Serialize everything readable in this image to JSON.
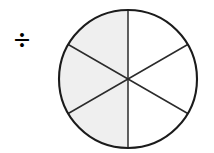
{
  "figure": {
    "name": "fraction-circle-division",
    "background_color": "#ffffff",
    "operator": {
      "glyph": "÷",
      "label": "division-sign",
      "color": "#000000"
    },
    "circle": {
      "center_x": 128,
      "center_y": 79,
      "radius": 69,
      "outline_color": "#1b1b1b",
      "outline_width": 2,
      "divider_color": "#2b2b2b",
      "divider_width": 1.5,
      "total_sectors": 6,
      "shaded_sectors": 3,
      "unshaded_sectors": 3,
      "shaded_fill": "#efefef",
      "unshaded_fill": "#ffffff",
      "fraction_shaded": "3/6",
      "sector_angle_degrees": 60,
      "diameter_angles_degrees": [
        90,
        30,
        150
      ],
      "sectors": [
        {
          "id": "sector-1",
          "start_deg": 90,
          "end_deg": 150,
          "shaded": true
        },
        {
          "id": "sector-2",
          "start_deg": 150,
          "end_deg": 210,
          "shaded": true
        },
        {
          "id": "sector-3",
          "start_deg": 210,
          "end_deg": 270,
          "shaded": true
        },
        {
          "id": "sector-4",
          "start_deg": 270,
          "end_deg": 330,
          "shaded": false
        },
        {
          "id": "sector-5",
          "start_deg": 330,
          "end_deg": 30,
          "shaded": false
        },
        {
          "id": "sector-6",
          "start_deg": 30,
          "end_deg": 90,
          "shaded": false
        }
      ]
    }
  }
}
